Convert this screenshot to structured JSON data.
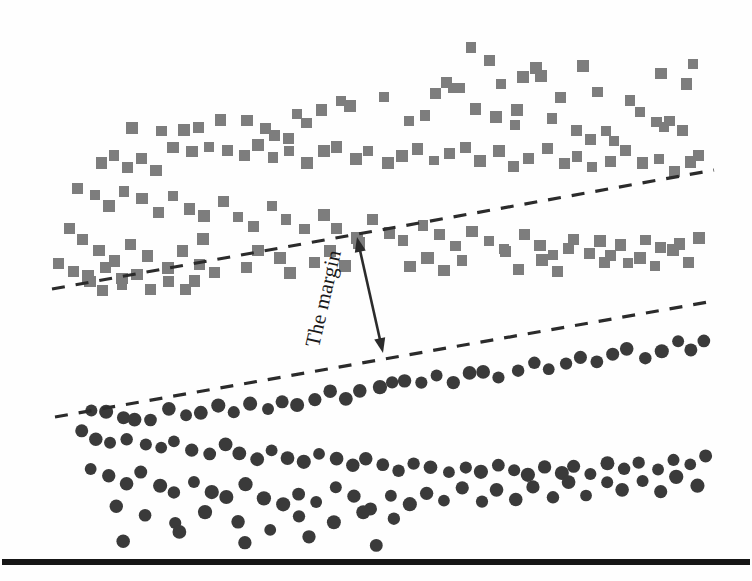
{
  "figure": {
    "name": "svm-margin-illustration",
    "background_color": "#fefefe",
    "width": 752,
    "height": 581
  },
  "annotation": {
    "margin_label": "The margin",
    "label_rotation_deg": -77,
    "label_x": 330,
    "label_y": 300,
    "arrow_color": "#2b2b2b",
    "arrow_width": 2.6,
    "arrow": {
      "x1": 357,
      "y1": 237,
      "x2": 383,
      "y2": 353
    }
  },
  "baseline": {
    "color": "#161616",
    "y": 562,
    "x1": 2,
    "x2": 750,
    "thickness": 6
  },
  "chart_data": {
    "type": "scatter",
    "title": "",
    "xlabel": "",
    "ylabel": "",
    "xlim": [
      0,
      752
    ],
    "ylim": [
      0,
      581
    ],
    "grid": false,
    "legend": null,
    "annotations": [
      {
        "text": "The margin",
        "x": 370,
        "y": 295,
        "rotation": -77
      }
    ],
    "decision_boundaries": [
      {
        "name": "upper-margin-line",
        "style": "dashed",
        "color": "#2b2b2b",
        "width": 3.2,
        "dasharray": "13 11",
        "x1": 52,
        "y1": 289,
        "x2": 714,
        "y2": 170
      },
      {
        "name": "lower-margin-line",
        "style": "dashed",
        "color": "#2b2b2b",
        "width": 3.2,
        "dasharray": "13 11",
        "x1": 55,
        "y1": 417,
        "x2": 714,
        "y2": 301
      }
    ],
    "series": [
      {
        "name": "class-a-squares",
        "marker": "square",
        "color": "#7d7d7d",
        "size": 11,
        "count": 118,
        "points": [
          [
            470,
            49
          ],
          [
            489,
            61
          ],
          [
            536,
            69
          ],
          [
            542,
            74
          ],
          [
            582,
            66
          ],
          [
            660,
            73
          ],
          [
            693,
            64
          ],
          [
            523,
            77
          ],
          [
            501,
            84
          ],
          [
            632,
            101
          ],
          [
            686,
            82
          ],
          [
            560,
            96
          ],
          [
            598,
            93
          ],
          [
            339,
            100
          ],
          [
            385,
            96
          ],
          [
            436,
            91
          ],
          [
            448,
            83
          ],
          [
            451,
            86
          ],
          [
            459,
            88
          ],
          [
            295,
            114
          ],
          [
            320,
            110
          ],
          [
            352,
            108
          ],
          [
            306,
            125
          ],
          [
            423,
            116
          ],
          [
            410,
            119
          ],
          [
            131,
            128
          ],
          [
            163,
            133
          ],
          [
            182,
            130
          ],
          [
            200,
            126
          ],
          [
            221,
            122
          ],
          [
            247,
            120
          ],
          [
            266,
            131
          ],
          [
            275,
            136
          ],
          [
            288,
            140
          ],
          [
            477,
            108
          ],
          [
            495,
            116
          ],
          [
            513,
            124
          ],
          [
            518,
            110
          ],
          [
            553,
            119
          ],
          [
            575,
            131
          ],
          [
            589,
            140
          ],
          [
            605,
            133
          ],
          [
            616,
            141
          ],
          [
            640,
            112
          ],
          [
            655,
            120
          ],
          [
            663,
            128
          ],
          [
            671,
            119
          ],
          [
            683,
            130
          ],
          [
            99,
            162
          ],
          [
            112,
            155
          ],
          [
            128,
            168
          ],
          [
            142,
            159
          ],
          [
            156,
            172
          ],
          [
            175,
            148
          ],
          [
            190,
            151
          ],
          [
            210,
            145
          ],
          [
            228,
            150
          ],
          [
            244,
            157
          ],
          [
            258,
            143
          ],
          [
            273,
            156
          ],
          [
            290,
            149
          ],
          [
            305,
            163
          ],
          [
            322,
            152
          ],
          [
            338,
            146
          ],
          [
            355,
            158
          ],
          [
            370,
            151
          ],
          [
            386,
            164
          ],
          [
            402,
            155
          ],
          [
            418,
            148
          ],
          [
            434,
            160
          ],
          [
            450,
            153
          ],
          [
            466,
            146
          ],
          [
            482,
            159
          ],
          [
            498,
            152
          ],
          [
            514,
            165
          ],
          [
            530,
            158
          ],
          [
            546,
            150
          ],
          [
            562,
            163
          ],
          [
            578,
            155
          ],
          [
            594,
            168
          ],
          [
            610,
            160
          ],
          [
            626,
            152
          ],
          [
            642,
            165
          ],
          [
            658,
            157
          ],
          [
            674,
            170
          ],
          [
            690,
            162
          ],
          [
            700,
            155
          ],
          [
            78,
            186
          ],
          [
            95,
            196
          ],
          [
            110,
            205
          ],
          [
            125,
            190
          ],
          [
            140,
            200
          ],
          [
            158,
            212
          ],
          [
            172,
            196
          ],
          [
            188,
            208
          ],
          [
            205,
            218
          ],
          [
            222,
            202
          ],
          [
            238,
            215
          ],
          [
            255,
            225
          ],
          [
            272,
            208
          ],
          [
            288,
            220
          ],
          [
            305,
            230
          ],
          [
            322,
            213
          ],
          [
            338,
            226
          ],
          [
            355,
            236
          ],
          [
            372,
            219
          ],
          [
            388,
            231
          ],
          [
            405,
            241
          ],
          [
            422,
            224
          ],
          [
            438,
            237
          ],
          [
            455,
            247
          ],
          [
            472,
            230
          ],
          [
            488,
            242
          ],
          [
            505,
            252
          ],
          [
            522,
            235
          ],
          [
            538,
            247
          ],
          [
            555,
            257
          ],
          [
            572,
            240
          ],
          [
            588,
            252
          ],
          [
            605,
            262
          ],
          [
            622,
            245
          ],
          [
            638,
            257
          ],
          [
            655,
            267
          ],
          [
            672,
            250
          ],
          [
            688,
            262
          ],
          [
            68,
            228
          ],
          [
            82,
            240
          ],
          [
            100,
            252
          ],
          [
            116,
            262
          ],
          [
            132,
            245
          ],
          [
            148,
            258
          ],
          [
            166,
            270
          ],
          [
            183,
            252
          ],
          [
            200,
            264
          ],
          [
            217,
            274
          ],
          [
            90,
            276
          ],
          [
            105,
            268
          ],
          [
            122,
            280
          ],
          [
            204,
            238
          ],
          [
            195,
            282
          ],
          [
            260,
            250
          ],
          [
            248,
            268
          ],
          [
            278,
            260
          ],
          [
            292,
            272
          ],
          [
            316,
            262
          ],
          [
            330,
            252
          ],
          [
            345,
            265
          ],
          [
            360,
            242
          ],
          [
            412,
            268
          ],
          [
            428,
            258
          ],
          [
            442,
            270
          ],
          [
            462,
            262
          ],
          [
            505,
            250
          ],
          [
            520,
            268
          ],
          [
            540,
            258
          ],
          [
            558,
            272
          ],
          [
            570,
            248
          ],
          [
            600,
            240
          ],
          [
            612,
            255
          ],
          [
            628,
            262
          ],
          [
            646,
            238
          ],
          [
            662,
            248
          ],
          [
            678,
            245
          ],
          [
            700,
            238
          ],
          [
            58,
            262
          ],
          [
            72,
            272
          ],
          [
            88,
            282
          ],
          [
            104,
            292
          ],
          [
            120,
            284
          ],
          [
            136,
            276
          ],
          [
            152,
            288
          ],
          [
            170,
            280
          ],
          [
            186,
            290
          ]
        ]
      },
      {
        "name": "class-b-circles",
        "marker": "circle",
        "color": "#3a3a3a",
        "size": 13,
        "count": 112,
        "points": [
          [
            93,
            409
          ],
          [
            108,
            414
          ],
          [
            122,
            420
          ],
          [
            136,
            418
          ],
          [
            152,
            422
          ],
          [
            168,
            410
          ],
          [
            184,
            417
          ],
          [
            200,
            412
          ],
          [
            216,
            406
          ],
          [
            232,
            411
          ],
          [
            250,
            402
          ],
          [
            266,
            408
          ],
          [
            282,
            400
          ],
          [
            298,
            405
          ],
          [
            314,
            398
          ],
          [
            330,
            392
          ],
          [
            346,
            397
          ],
          [
            362,
            390
          ],
          [
            378,
            385
          ],
          [
            390,
            382
          ],
          [
            404,
            379
          ],
          [
            420,
            384
          ],
          [
            436,
            377
          ],
          [
            452,
            382
          ],
          [
            468,
            375
          ],
          [
            484,
            370
          ],
          [
            500,
            376
          ],
          [
            516,
            369
          ],
          [
            532,
            364
          ],
          [
            548,
            370
          ],
          [
            564,
            363
          ],
          [
            580,
            357
          ],
          [
            596,
            362
          ],
          [
            612,
            356
          ],
          [
            628,
            350
          ],
          [
            644,
            356
          ],
          [
            660,
            349
          ],
          [
            676,
            343
          ],
          [
            692,
            348
          ],
          [
            706,
            342
          ],
          [
            80,
            432
          ],
          [
            96,
            438
          ],
          [
            112,
            444
          ],
          [
            128,
            437
          ],
          [
            144,
            443
          ],
          [
            160,
            449
          ],
          [
            176,
            442
          ],
          [
            192,
            448
          ],
          [
            208,
            454
          ],
          [
            224,
            446
          ],
          [
            240,
            452
          ],
          [
            256,
            458
          ],
          [
            272,
            450
          ],
          [
            288,
            456
          ],
          [
            304,
            462
          ],
          [
            320,
            454
          ],
          [
            336,
            460
          ],
          [
            352,
            466
          ],
          [
            368,
            458
          ],
          [
            384,
            464
          ],
          [
            400,
            470
          ],
          [
            416,
            462
          ],
          [
            432,
            468
          ],
          [
            448,
            474
          ],
          [
            464,
            466
          ],
          [
            480,
            472
          ],
          [
            496,
            464
          ],
          [
            512,
            470
          ],
          [
            528,
            476
          ],
          [
            544,
            468
          ],
          [
            560,
            474
          ],
          [
            576,
            466
          ],
          [
            592,
            472
          ],
          [
            608,
            464
          ],
          [
            624,
            470
          ],
          [
            640,
            462
          ],
          [
            656,
            468
          ],
          [
            672,
            460
          ],
          [
            688,
            466
          ],
          [
            704,
            458
          ],
          [
            92,
            468
          ],
          [
            110,
            478
          ],
          [
            126,
            486
          ],
          [
            142,
            474
          ],
          [
            158,
            484
          ],
          [
            176,
            492
          ],
          [
            194,
            480
          ],
          [
            210,
            490
          ],
          [
            228,
            498
          ],
          [
            246,
            486
          ],
          [
            264,
            496
          ],
          [
            282,
            504
          ],
          [
            300,
            492
          ],
          [
            318,
            500
          ],
          [
            336,
            488
          ],
          [
            354,
            498
          ],
          [
            372,
            508
          ],
          [
            390,
            494
          ],
          [
            408,
            504
          ],
          [
            426,
            492
          ],
          [
            444,
            502
          ],
          [
            462,
            490
          ],
          [
            480,
            500
          ],
          [
            498,
            488
          ],
          [
            516,
            498
          ],
          [
            534,
            486
          ],
          [
            552,
            496
          ],
          [
            570,
            484
          ],
          [
            588,
            494
          ],
          [
            606,
            482
          ],
          [
            624,
            492
          ],
          [
            642,
            480
          ],
          [
            660,
            490
          ],
          [
            678,
            478
          ],
          [
            696,
            488
          ],
          [
            118,
            508
          ],
          [
            146,
            516
          ],
          [
            176,
            524
          ],
          [
            206,
            512
          ],
          [
            240,
            520
          ],
          [
            270,
            528
          ],
          [
            300,
            516
          ],
          [
            334,
            524
          ],
          [
            364,
            512
          ],
          [
            392,
            520
          ],
          [
            122,
            540
          ],
          [
            180,
            534
          ],
          [
            246,
            542
          ],
          [
            310,
            536
          ],
          [
            376,
            544
          ]
        ]
      }
    ]
  }
}
